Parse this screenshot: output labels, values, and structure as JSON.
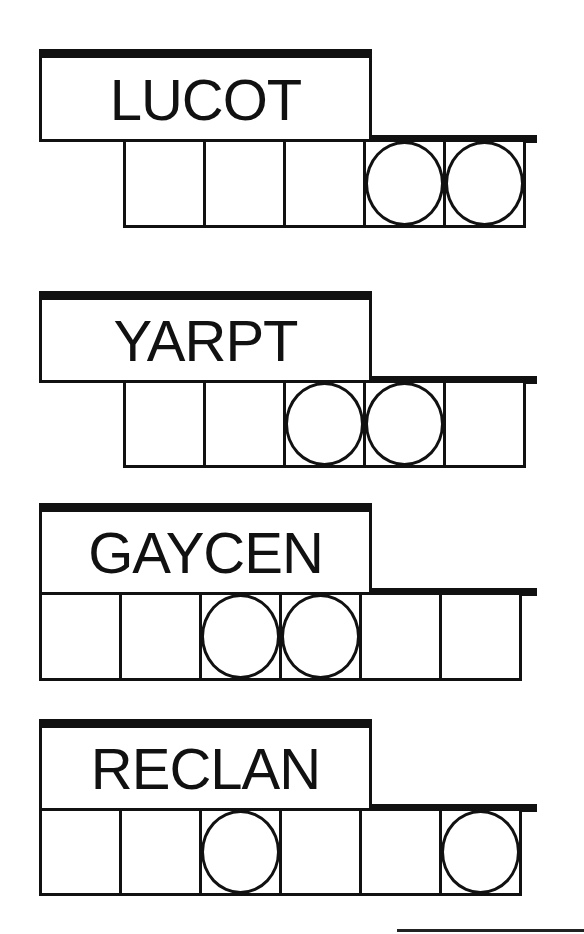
{
  "game": "jumble-word-puzzle",
  "puzzles": [
    {
      "clue": "LUCOT",
      "cell_count": 5,
      "cells_start_index": 1,
      "circled_cells": [
        4,
        5
      ]
    },
    {
      "clue": "YARPT",
      "cell_count": 5,
      "cells_start_index": 1,
      "circled_cells": [
        3,
        4
      ]
    },
    {
      "clue": "GAYCEN",
      "cell_count": 6,
      "cells_start_index": 0,
      "circled_cells": [
        3,
        4
      ]
    },
    {
      "clue": "RECLAN",
      "cell_count": 6,
      "cells_start_index": 0,
      "circled_cells": [
        3,
        6
      ]
    }
  ],
  "colors": {
    "ink": "#111111",
    "background": "#ffffff"
  }
}
